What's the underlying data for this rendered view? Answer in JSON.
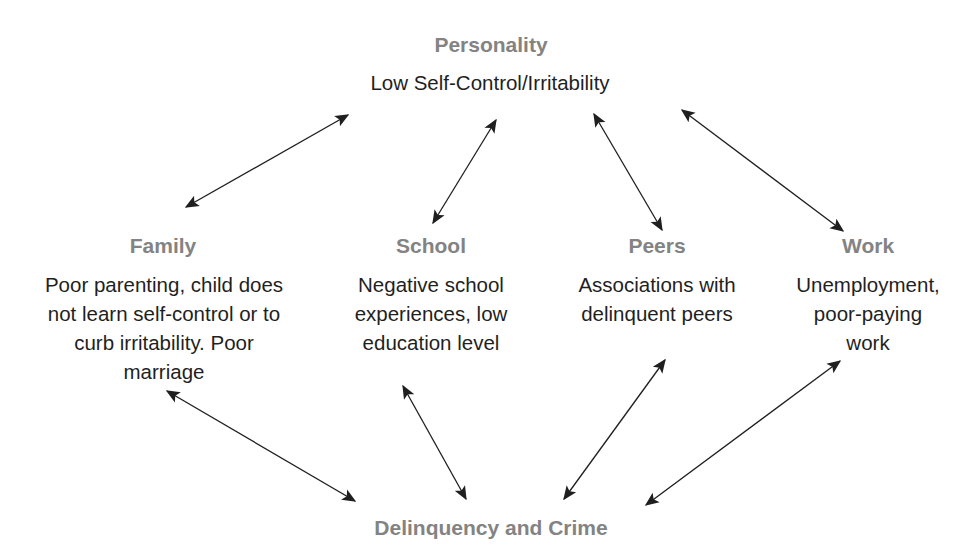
{
  "diagram": {
    "top": {
      "title": "Personality",
      "description": "Low Self-Control/Irritability"
    },
    "middle": [
      {
        "id": "family",
        "title": "Family",
        "lines": [
          "Poor parenting, child does",
          "not learn self-control or to",
          "curb irritability. Poor",
          "marriage"
        ]
      },
      {
        "id": "school",
        "title": "School",
        "lines": [
          "Negative school",
          "experiences, low",
          "education level"
        ]
      },
      {
        "id": "peers",
        "title": "Peers",
        "lines": [
          "Associations with",
          "delinquent peers"
        ]
      },
      {
        "id": "work",
        "title": "Work",
        "lines": [
          "Unemployment,",
          "poor-paying",
          "work"
        ]
      }
    ],
    "bottom": {
      "title": "Delinquency and Crime"
    },
    "edges": [
      {
        "from": "personality",
        "to": "family",
        "type": "bidirectional"
      },
      {
        "from": "personality",
        "to": "school",
        "type": "bidirectional"
      },
      {
        "from": "personality",
        "to": "peers",
        "type": "bidirectional"
      },
      {
        "from": "personality",
        "to": "work",
        "type": "bidirectional"
      },
      {
        "from": "family",
        "to": "delinquency-and-crime",
        "type": "bidirectional"
      },
      {
        "from": "school",
        "to": "delinquency-and-crime",
        "type": "bidirectional"
      },
      {
        "from": "peers",
        "to": "delinquency-and-crime",
        "type": "bidirectional"
      },
      {
        "from": "work",
        "to": "delinquency-and-crime",
        "type": "bidirectional"
      }
    ],
    "colors": {
      "title": "#838383",
      "text": "#1f1f1f",
      "arrow": "#1f1f1f"
    }
  }
}
